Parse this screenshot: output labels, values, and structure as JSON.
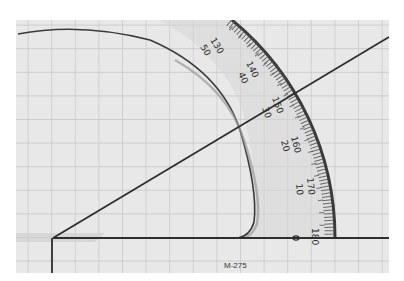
{
  "scene": {
    "description": "Photograph of a clear plastic semicircular protractor placed on grid paper, measuring an angle drawn with two lines from a vertex",
    "model_label": "M-275",
    "scale_outer_labels": [
      "130",
      "140",
      "150",
      "160",
      "170",
      "180"
    ],
    "scale_inner_labels": [
      "50",
      "40",
      "30",
      "20",
      "10",
      "0"
    ],
    "measured_angle_reading": "30",
    "colors": {
      "paper": "#e6e6e6",
      "grid": "#c2c2c2",
      "ink": "#2e2e2e",
      "protractor_tint": "#dcdcdc"
    }
  }
}
